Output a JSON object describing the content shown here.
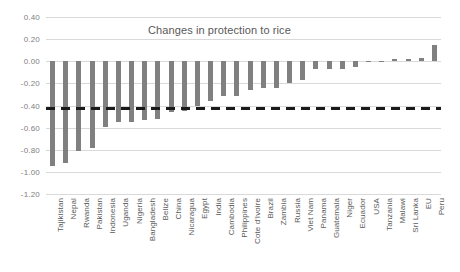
{
  "chart_data": {
    "type": "bar",
    "title": "Changes in protection to rice",
    "xlabel": "",
    "ylabel": "",
    "ylim": [
      -1.2,
      0.4
    ],
    "grid": true,
    "legend": "none",
    "ytick_labels": [
      "0.40",
      "0.20",
      "0.00",
      "-0.20",
      "-0.40",
      "-0.60",
      "-0.80",
      "-1.00",
      "-1.20"
    ],
    "ytick_values": [
      0.4,
      0.2,
      0.0,
      -0.2,
      -0.4,
      -0.6,
      -0.8,
      -1.0,
      -1.2
    ],
    "reference_line": {
      "label": "average change",
      "value": -0.42,
      "style": "dashed",
      "color": "#1a1a1a"
    },
    "bar_color": "#808080",
    "categories": [
      "Tajikistan",
      "Nepal",
      "Rwanda",
      "Pakistan",
      "Indonesia",
      "Uganda",
      "Nigeria",
      "Bangladesh",
      "Belize",
      "China",
      "Nicaragua",
      "Egypt",
      "India",
      "Cambodia",
      "Philippines",
      "Cote d'Ivoire",
      "Brazil",
      "Zambia",
      "Russia",
      "Viet Nam",
      "Panama",
      "Guatemala",
      "Niger",
      "Ecuador",
      "USA",
      "Tanzania",
      "Malawi",
      "Sri Lanka",
      "EU",
      "Peru"
    ],
    "values": [
      -0.95,
      -0.92,
      -0.81,
      -0.78,
      -0.59,
      -0.55,
      -0.55,
      -0.53,
      -0.52,
      -0.46,
      -0.45,
      -0.4,
      -0.36,
      -0.31,
      -0.31,
      -0.26,
      -0.24,
      -0.24,
      -0.2,
      -0.17,
      -0.07,
      -0.07,
      -0.07,
      -0.05,
      -0.005,
      -0.005,
      0.02,
      0.02,
      0.03,
      0.15
    ]
  }
}
